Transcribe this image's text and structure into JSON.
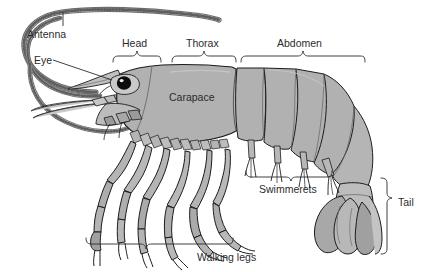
{
  "diagram": {
    "background_color": "#ffffff",
    "body_fill": "#b1b1b1",
    "body_fill_light": "#c4c4c4",
    "body_fill_dark": "#9a9a9a",
    "outline_color": "#1c1c1c",
    "text_color": "#2b2b2b",
    "labels": [
      {
        "id": "antenna",
        "text": "Antenna",
        "x": 27,
        "y": 36,
        "leader": "line",
        "anchor": "start"
      },
      {
        "id": "eye",
        "text": "Eye",
        "x": 34,
        "y": 61,
        "leader": "line",
        "anchor": "start"
      },
      {
        "id": "head",
        "text": "Head",
        "x": 122,
        "y": 45,
        "leader": "bracket",
        "anchor": "start"
      },
      {
        "id": "thorax",
        "text": "Thorax",
        "x": 191,
        "y": 45,
        "leader": "bracket",
        "anchor": "start"
      },
      {
        "id": "abdomen",
        "text": "Abdomen",
        "x": 274,
        "y": 45,
        "leader": "bracket",
        "anchor": "start"
      },
      {
        "id": "carapace",
        "text": "Carapace",
        "x": 169,
        "y": 99,
        "leader": "none",
        "anchor": "start"
      },
      {
        "id": "swimmerets",
        "text": "Swimmerets",
        "x": 259,
        "y": 190,
        "leader": "bracket",
        "anchor": "start"
      },
      {
        "id": "walking-legs",
        "text": "Walking legs",
        "x": 197,
        "y": 258,
        "leader": "bracket",
        "anchor": "start"
      },
      {
        "id": "tail",
        "text": "Tail",
        "x": 398,
        "y": 203,
        "leader": "bracket",
        "anchor": "start"
      }
    ]
  }
}
